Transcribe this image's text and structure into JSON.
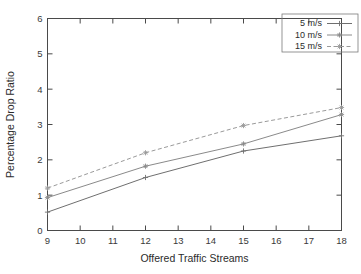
{
  "chart_data": {
    "type": "line",
    "title": "",
    "xlabel": "Offered Traffic Streams",
    "ylabel": "Percentage Drop Ratio",
    "x": [
      9,
      12,
      15,
      18
    ],
    "xlim": [
      9,
      18
    ],
    "ylim": [
      0,
      6
    ],
    "xticks": [
      "9",
      "10",
      "11",
      "12",
      "13",
      "14",
      "15",
      "16",
      "17",
      "18"
    ],
    "yticks": [
      "0",
      "1",
      "2",
      "3",
      "4",
      "5",
      "6"
    ],
    "grid": false,
    "legend_position": "top-right",
    "series": [
      {
        "name": "5 m/s",
        "values": [
          0.52,
          1.5,
          2.25,
          2.68
        ],
        "color": "#6f6f6f",
        "dash": "none",
        "marker": "plus"
      },
      {
        "name": "10 m/s",
        "values": [
          0.93,
          1.82,
          2.45,
          3.28
        ],
        "color": "#8a8a8a",
        "dash": "none",
        "marker": "asterisk"
      },
      {
        "name": "15 m/s",
        "values": [
          1.2,
          2.2,
          2.97,
          3.48
        ],
        "color": "#9a9a9a",
        "dash": "dashed",
        "marker": "asterisk"
      }
    ]
  },
  "legend": {
    "entries": [
      {
        "label": "5 m/s"
      },
      {
        "label": "10 m/s"
      },
      {
        "label": "15 m/s"
      }
    ]
  },
  "axes": {
    "x_title": "Offered Traffic Streams",
    "y_title": "Percentage Drop Ratio"
  }
}
